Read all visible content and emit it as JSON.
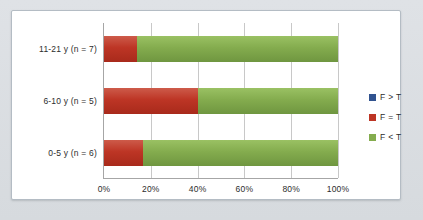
{
  "chart_data": {
    "type": "bar",
    "orientation": "horizontal",
    "stacked": true,
    "normalized": true,
    "title": "",
    "subtitle": "",
    "xlabel": "",
    "ylabel": "",
    "categories": [
      "0-5 y  (n = 6)",
      "6-10 y  (n = 5)",
      "11-21 y  (n = 7)"
    ],
    "category_order_top_to_bottom": [
      "11-21 y  (n = 7)",
      "6-10 y  (n = 5)",
      "0-5 y  (n = 6)"
    ],
    "series": [
      {
        "name": "F > T",
        "color": "#31538f",
        "values": [
          0,
          0,
          0
        ]
      },
      {
        "name": "F = T",
        "color": "#bd3525",
        "values": [
          16.7,
          40.0,
          14.3
        ]
      },
      {
        "name": "F < T",
        "color": "#84ac4e",
        "values": [
          83.3,
          60.0,
          85.7
        ]
      }
    ],
    "xlim": [
      0,
      100
    ],
    "xticks": [
      0,
      20,
      40,
      60,
      80,
      100
    ],
    "xtick_labels": [
      "0%",
      "20%",
      "40%",
      "60%",
      "80%",
      "100%"
    ],
    "grid": {
      "vertical": true,
      "horizontal": false
    },
    "legend": {
      "position": "right",
      "entries": [
        {
          "label": "F > T",
          "color": "#31538f"
        },
        {
          "label": "F = T",
          "color": "#bd3525"
        },
        {
          "label": "F < T",
          "color": "#84ac4e"
        }
      ]
    },
    "colors": {
      "background": "#dcdfe3",
      "plot_background": "#ffffff",
      "frame_border": "#b4bcc4",
      "axis_line": "#a6a6a6",
      "gridline": "#c8c8c8",
      "text": "#2c2c2c"
    }
  }
}
